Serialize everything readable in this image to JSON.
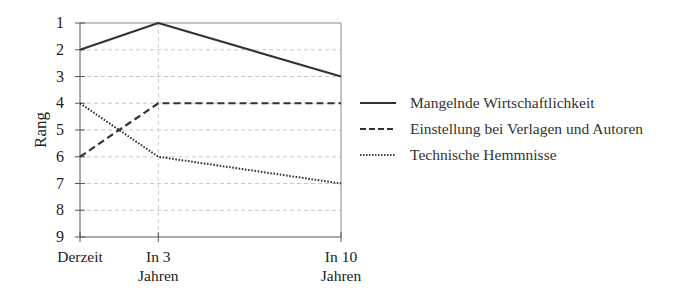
{
  "chart_data": {
    "type": "line",
    "title": "",
    "xlabel": "",
    "ylabel": "Rang",
    "categories": [
      "Derzeit",
      "In 3 Jahren",
      "In 10 Jahren"
    ],
    "category_lines": [
      [
        "Derzeit"
      ],
      [
        "In 3",
        "Jahren"
      ],
      [
        "In 10",
        "Jahren"
      ]
    ],
    "x_positions": [
      0,
      3,
      10
    ],
    "ylim": [
      1,
      9
    ],
    "y_inverted": true,
    "yticks": [
      1,
      2,
      3,
      4,
      5,
      6,
      7,
      8,
      9
    ],
    "grid": true,
    "legend_position": "right",
    "series": [
      {
        "name": "Mangelnde Wirtschaftlichkeit",
        "style": "solid",
        "values": [
          2,
          1,
          3
        ]
      },
      {
        "name": "Einstellung bei Verlagen und Autoren",
        "style": "dashed",
        "values": [
          6,
          4,
          4
        ]
      },
      {
        "name": "Technische Hemmnisse",
        "style": "dotted",
        "values": [
          4,
          6,
          7
        ]
      }
    ]
  },
  "colors": {
    "line": "#333333",
    "grid": "#c8c8c8",
    "axis": "#888888"
  }
}
